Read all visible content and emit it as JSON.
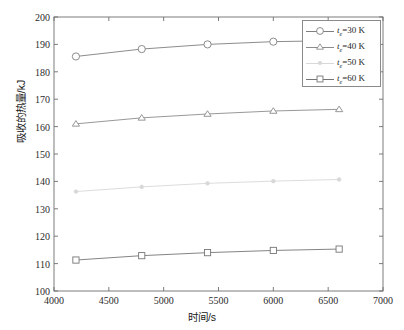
{
  "chart_data": {
    "type": "line",
    "title": "",
    "xlabel": "时间/s",
    "ylabel": "吸收的热量/kJ",
    "xlim": [
      4000,
      7000
    ],
    "ylim": [
      100,
      200
    ],
    "xticks": [
      4000,
      4500,
      5000,
      5500,
      6000,
      6500,
      7000
    ],
    "yticks": [
      100,
      110,
      120,
      130,
      140,
      150,
      160,
      170,
      180,
      190,
      200
    ],
    "grid": false,
    "legend_position": "upper right",
    "x": [
      4200,
      4800,
      5400,
      6000,
      6600
    ],
    "series": [
      {
        "name": "t_e=30 K",
        "label_main": "t",
        "label_sub": "e",
        "label_rest": "=30 K",
        "marker": "circle",
        "color": "#7f7f7f",
        "values": [
          185.6,
          188.3,
          190.0,
          191.0,
          191.4
        ]
      },
      {
        "name": "t_e=40 K",
        "label_main": "t",
        "label_sub": "e",
        "label_rest": "=40 K",
        "marker": "triangle",
        "color": "#8c8c8c",
        "values": [
          161.0,
          163.2,
          164.6,
          165.7,
          166.3
        ]
      },
      {
        "name": "t_e=50 K",
        "label_main": "t",
        "label_sub": "e",
        "label_rest": "=50 K",
        "marker": "dot",
        "color": "#d8d8d8",
        "values": [
          136.3,
          138.0,
          139.3,
          140.1,
          140.7
        ]
      },
      {
        "name": "t_e=60 K",
        "label_main": "t",
        "label_sub": "e",
        "label_rest": "=60 K",
        "marker": "square",
        "color": "#767676",
        "values": [
          111.3,
          112.9,
          114.0,
          114.8,
          115.3
        ]
      }
    ]
  },
  "axis": {
    "frame_color": "#6e6e6e",
    "tick_color": "#6e6e6e"
  }
}
